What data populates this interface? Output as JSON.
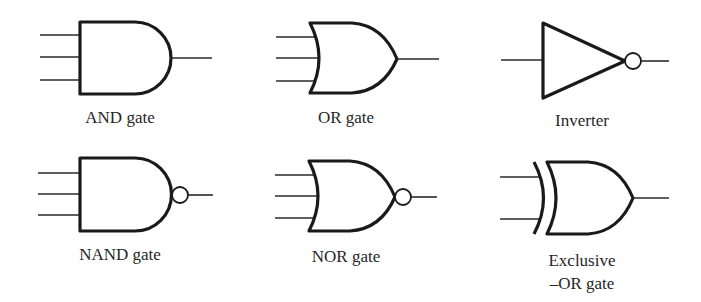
{
  "figure": {
    "background": "#ffffff",
    "stroke_color": "#1a1a1a",
    "gates": [
      {
        "id": "and",
        "label_lines": [
          "AND gate"
        ],
        "type": "AND",
        "inputs": 3,
        "inverted_output": false
      },
      {
        "id": "or",
        "label_lines": [
          "OR gate"
        ],
        "type": "OR",
        "inputs": 3,
        "inverted_output": false
      },
      {
        "id": "inverter",
        "label_lines": [
          "Inverter"
        ],
        "type": "NOT",
        "inputs": 1,
        "inverted_output": true
      },
      {
        "id": "nand",
        "label_lines": [
          "NAND gate"
        ],
        "type": "NAND",
        "inputs": 3,
        "inverted_output": true
      },
      {
        "id": "nor",
        "label_lines": [
          "NOR gate"
        ],
        "type": "NOR",
        "inputs": 3,
        "inverted_output": true
      },
      {
        "id": "xor",
        "label_lines": [
          "Exclusive",
          "–OR gate"
        ],
        "type": "XOR",
        "inputs": 2,
        "inverted_output": false
      }
    ]
  }
}
